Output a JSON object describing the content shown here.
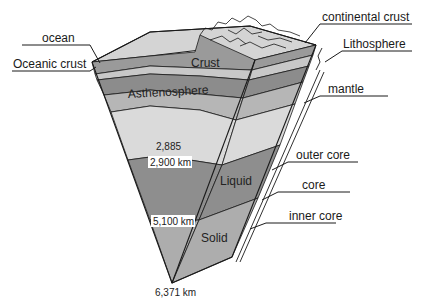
{
  "diagram": {
    "callouts": {
      "ocean": "ocean",
      "oceanic_crust": "Oceanic crust",
      "continental_crust": "continental crust",
      "lithosphere": "Lithosphere",
      "mantle": "mantle",
      "outer_core": "outer core",
      "core": "core",
      "inner_core": "inner core"
    },
    "layer_labels": {
      "crust": "Crust",
      "asthenosphere": "Asthenosphere",
      "liquid": "Liquid",
      "solid": "Solid"
    },
    "depths": {
      "d2885": "2,885",
      "d2900": "2,900 km",
      "d5100": "5,100 km",
      "d6371": "6,371 km"
    },
    "colors": {
      "surface": "#d6d6d6",
      "crust": "#8e8e8e",
      "upper_mantle_light": "#c4c4c4",
      "asthenosphere": "#8a8a8a",
      "lower_mantle": "#b4b4b4",
      "deep_mantle": "#d9d9d9",
      "outer_core": "#8c8c8c",
      "inner_core": "#adadad",
      "outline": "#1a1a1a"
    }
  }
}
